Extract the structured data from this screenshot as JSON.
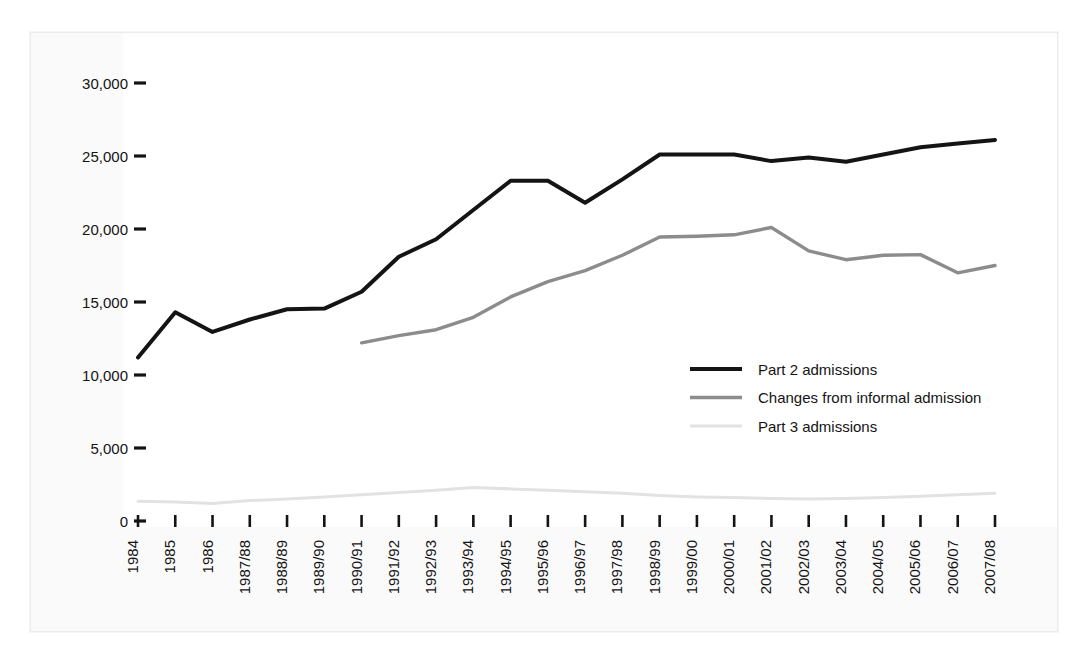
{
  "chart_data": {
    "type": "line",
    "title": "",
    "subtitle": "",
    "xlabel": "",
    "ylabel": "",
    "ylim": [
      0,
      30000
    ],
    "yticks": [
      0,
      5000,
      10000,
      15000,
      20000,
      25000,
      30000
    ],
    "ytick_labels": [
      "0",
      "5,000",
      "10,000",
      "15,000",
      "20,000",
      "25,000",
      "30,000"
    ],
    "grid": false,
    "legend_position": "center-right",
    "categories": [
      "1984",
      "1985",
      "1986",
      "1987/88",
      "1988/89",
      "1989/90",
      "1990/91",
      "1991/92",
      "1992/93",
      "1993/94",
      "1994/95",
      "1995/96",
      "1996/97",
      "1997/98",
      "1998/99",
      "1999/00",
      "2000/01",
      "2001/02",
      "2002/03",
      "2003/04",
      "2004/05",
      "2005/06",
      "2006/07",
      "2007/08"
    ],
    "series": [
      {
        "name": "Part 2 admissions",
        "color": "#141414",
        "width": 4.0,
        "values": [
          11200,
          14300,
          12950,
          13800,
          14500,
          14550,
          15700,
          18100,
          19300,
          21300,
          23300,
          23300,
          21800,
          23400,
          25100,
          25100,
          25100,
          24650,
          24900,
          24600,
          25100,
          25600,
          25850,
          26100
        ]
      },
      {
        "name": "Changes from informal admission",
        "color": "#8c8c8c",
        "width": 3.4,
        "values": [
          null,
          null,
          null,
          null,
          null,
          null,
          12200,
          12700,
          13100,
          13950,
          15350,
          16400,
          17150,
          18200,
          19450,
          19500,
          19600,
          20100,
          18500,
          17900,
          18200,
          18250,
          17000,
          17500
        ]
      },
      {
        "name": "Part 3 admissions",
        "color": "#e2e2e2",
        "width": 3.0,
        "values": [
          1350,
          1300,
          1200,
          1400,
          1500,
          1650,
          1800,
          1950,
          2100,
          2300,
          2200,
          2100,
          2000,
          1900,
          1750,
          1650,
          1600,
          1550,
          1500,
          1550,
          1600,
          1700,
          1800,
          1900
        ]
      }
    ]
  },
  "legend": {
    "items": [
      {
        "label": "Part 2 admissions",
        "color": "#141414"
      },
      {
        "label": "Changes from informal admission",
        "color": "#8c8c8c"
      },
      {
        "label": "Part 3 admissions",
        "color": "#e2e2e2"
      }
    ]
  },
  "axes": {
    "y_tick_mark_color": "#141414",
    "x_tick_mark_color": "#141414"
  }
}
